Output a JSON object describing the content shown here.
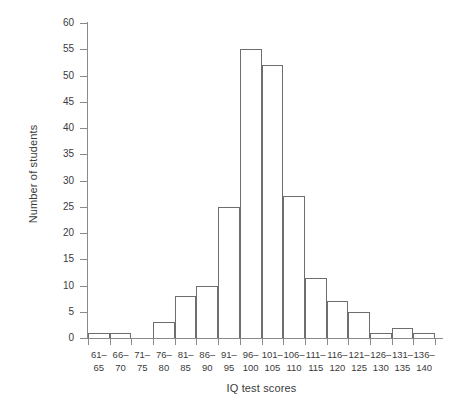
{
  "chart_data": {
    "type": "bar",
    "title": "",
    "xlabel": "IQ test scores",
    "ylabel": "Number of students",
    "categories": [
      "61–\n65",
      "66–\n70",
      "71–\n75",
      "76–\n80",
      "81–\n85",
      "86–\n90",
      "91–\n95",
      "96–\n100",
      "101–\n105",
      "106–\n110",
      "111–\n115",
      "116–\n120",
      "121–\n125",
      "126–\n130",
      "131–\n135",
      "136–\n140"
    ],
    "bin_starts": [
      61,
      66,
      71,
      76,
      81,
      86,
      91,
      96,
      101,
      106,
      111,
      116,
      121,
      126,
      131,
      136
    ],
    "bin_ends": [
      65,
      70,
      75,
      80,
      85,
      90,
      95,
      100,
      105,
      110,
      115,
      120,
      125,
      130,
      135,
      140
    ],
    "values": [
      1,
      1,
      0,
      3,
      8,
      10,
      25,
      55,
      52,
      27,
      11.5,
      7,
      5,
      1,
      2,
      1
    ],
    "ylim": [
      0,
      60
    ],
    "yticks": [
      0,
      5,
      10,
      15,
      20,
      25,
      30,
      35,
      40,
      45,
      50,
      55,
      60
    ],
    "ytick_labels": [
      "0",
      "5",
      "10",
      "15",
      "20",
      "25",
      "30",
      "35",
      "40",
      "45",
      "50",
      "55",
      "60"
    ],
    "grid": false,
    "legend": null,
    "bar_edge_color": "#6e6e6e",
    "bar_fill_color": "none",
    "axis_color": "#8a8a8a",
    "text_color": "#3b3b3b"
  }
}
